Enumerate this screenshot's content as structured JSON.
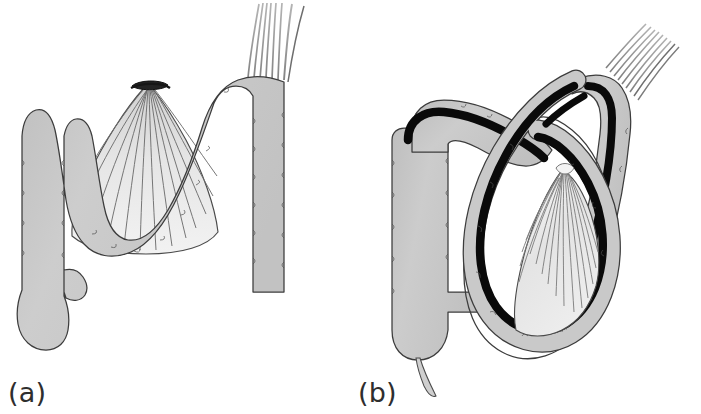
{
  "figure": {
    "caption_a": "(a)",
    "caption_b": "(b)",
    "background_color": "#ffffff"
  },
  "colors": {
    "bowel_fill": "#c8c8c8",
    "bowel_fill_light": "#d6d6d6",
    "bowel_outline": "#3a3a3a",
    "mesentery_fill": "#e8e8e8",
    "mesentery_line": "#6a6a6a",
    "mesenteric_band": "#0a0a0a",
    "vessel_line": "#8a8a8a",
    "label_text": "#2e2e2e",
    "background": "#ffffff"
  },
  "panel_a": {
    "title": "normal sigmoid colon with broad mesenteric base",
    "parts": [
      {
        "name": "cecum",
        "label": "cecum"
      },
      {
        "name": "appendix",
        "label": "appendix"
      },
      {
        "name": "ascending-colon",
        "label": "ascending colon"
      },
      {
        "name": "sigmoid-loop",
        "label": "sigmoid loop"
      },
      {
        "name": "descending-colon",
        "label": "descending colon"
      },
      {
        "name": "mesentery-fan",
        "label": "mesentery"
      },
      {
        "name": "mesenteric-root",
        "label": "mesenteric root"
      },
      {
        "name": "vessel-bundle",
        "label": "vessels"
      }
    ],
    "mesentery_ray_count": 13,
    "vessel_strand_count": 7
  },
  "panel_b": {
    "title": "sigmoid volvulus with twisted narrow mesenteric base",
    "parts": [
      {
        "name": "cecum",
        "label": "cecum"
      },
      {
        "name": "appendix",
        "label": "appendix"
      },
      {
        "name": "ascending-colon",
        "label": "ascending colon"
      },
      {
        "name": "hepatic-flexure",
        "label": "hepatic flexure"
      },
      {
        "name": "volvulus-loop",
        "label": "twisted loop"
      },
      {
        "name": "twist-point",
        "label": "point of torsion"
      },
      {
        "name": "descending-colon",
        "label": "descending colon"
      },
      {
        "name": "mesentery-fan",
        "label": "compressed mesentery"
      },
      {
        "name": "mesenteric-band",
        "label": "mesenteric band"
      },
      {
        "name": "vessel-bundle",
        "label": "vessels"
      }
    ],
    "mesentery_ray_count": 16,
    "vessel_strand_count": 9
  }
}
